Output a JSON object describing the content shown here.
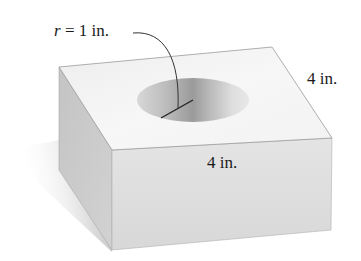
{
  "figure": {
    "labels": {
      "radius": {
        "var": "r",
        "rest": " = 1 in."
      },
      "depth": "4 in.",
      "side": "4 in."
    },
    "colors": {
      "top_face": "#f4f4f4",
      "front_face": "#dedede",
      "left_face": "#c9c9c9",
      "shadow": "#bdbdbd",
      "edge": "#9a9a9a",
      "leader_line": "#333333"
    }
  }
}
